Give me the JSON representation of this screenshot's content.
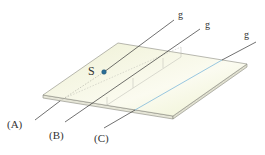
{
  "figure": {
    "point_label": "S",
    "line_name": "g",
    "lines": [
      {
        "id": "A",
        "label": "(A)",
        "name": "g"
      },
      {
        "id": "B",
        "label": "(B)",
        "name": "g"
      },
      {
        "id": "C",
        "label": "(C)",
        "name": "g"
      }
    ],
    "colors": {
      "plate_fill": "#f4f5e2",
      "plate_edge": "#8a8a80",
      "line": "#333333",
      "line_in_plane": "#6fb0d8",
      "point": "#2a6e96"
    }
  }
}
